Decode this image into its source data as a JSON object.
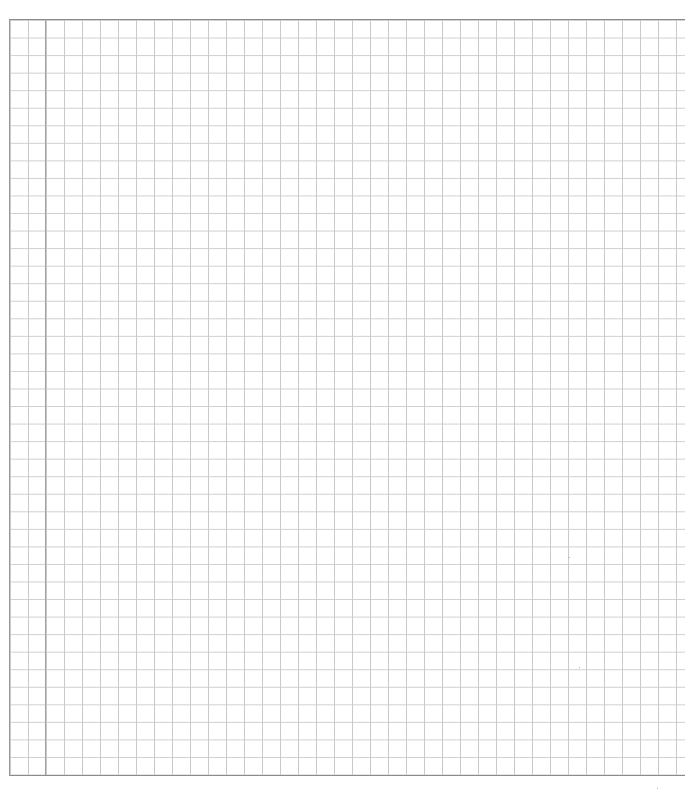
{
  "page": {
    "type": "graph-paper",
    "grid_spacing_px": 18,
    "colors": {
      "background": "#ffffff",
      "grid_line": "#c9c9c9",
      "border_line": "#8a8a8a",
      "margin_line": "#a0a0a0"
    }
  }
}
